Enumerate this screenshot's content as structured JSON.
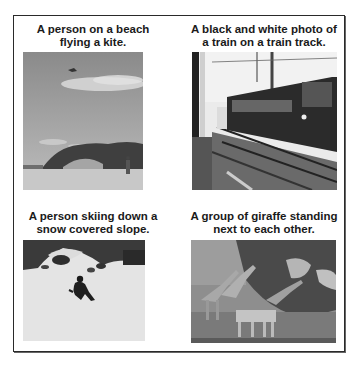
{
  "panels": [
    {
      "caption_line1": "A person on a beach",
      "caption_line2": "flying a kite.",
      "image_subject": "beach-kite-photo"
    },
    {
      "caption_line1": "A black and white photo of",
      "caption_line2": "a train on a train track.",
      "image_subject": "train-track-photo"
    },
    {
      "caption_line1": "A person skiing down a",
      "caption_line2": "snow covered slope.",
      "image_subject": "skiing-photo"
    },
    {
      "caption_line1": "A group of giraffe standing",
      "caption_line2": "next to each other.",
      "image_subject": "giraffes-photo"
    }
  ]
}
